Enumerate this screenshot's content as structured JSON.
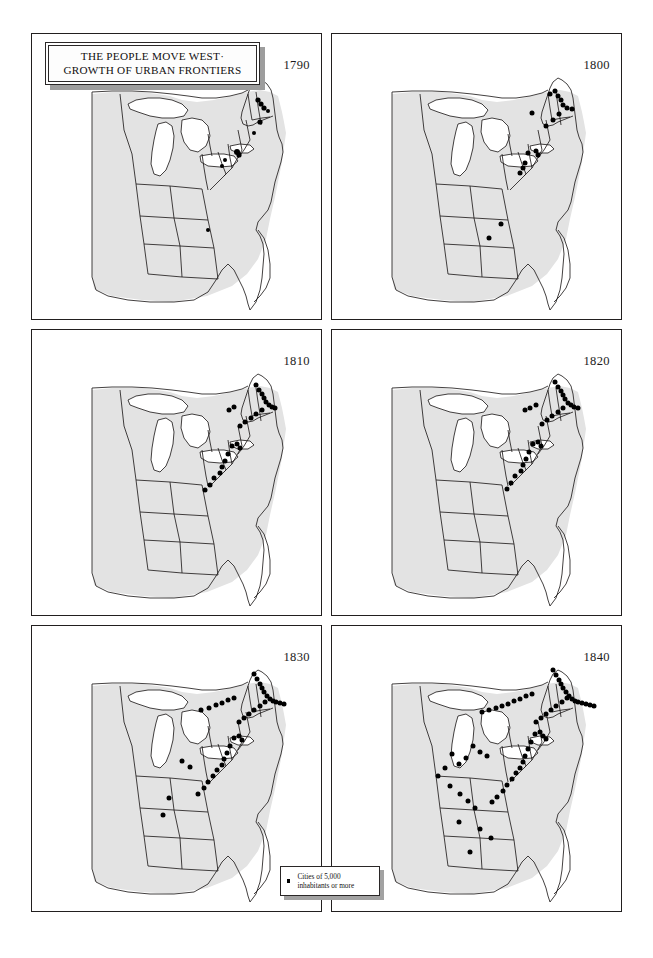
{
  "figure": {
    "title_line1": "THE PEOPLE MOVE WEST·",
    "title_line2": "GROWTH OF URBAN FRONTIERS",
    "land_color": "#e3e3e3",
    "water_color": "#ffffff",
    "border_color": "#221f1f",
    "dot_color": "#000000"
  },
  "legend": {
    "marker": "square-dot-icon",
    "line1": "Cities of 5,000",
    "line2": "inhabitants or more"
  },
  "panels": [
    {
      "year": "1790",
      "row": 0,
      "col": 0,
      "city_count": 11
    },
    {
      "year": "1800",
      "row": 0,
      "col": 1,
      "city_count": 18
    },
    {
      "year": "1810",
      "row": 1,
      "col": 0,
      "city_count": 25
    },
    {
      "year": "1820",
      "row": 1,
      "col": 1,
      "city_count": 27
    },
    {
      "year": "1830",
      "row": 2,
      "col": 0,
      "city_count": 39
    },
    {
      "year": "1840",
      "row": 2,
      "col": 1,
      "city_count": 61
    }
  ],
  "chart_data": {
    "type": "map",
    "title": "THE PEOPLE MOVE WEST· GROWTH OF URBAN FRONTIERS",
    "legend_entries": [
      "Cities of 5,000 inhabitants or more"
    ],
    "legend_position": "bottom-center",
    "region": "Eastern United States",
    "small_multiples": true,
    "grid": [
      2,
      3
    ],
    "series_label": "decade",
    "categories": [
      "1790",
      "1800",
      "1810",
      "1820",
      "1830",
      "1840"
    ],
    "values": [
      11,
      18,
      25,
      27,
      39,
      61
    ],
    "ylabel": "Number of cities of 5,000 inhabitants or more",
    "cities": {
      "1790": [
        [
          226,
          66
        ],
        [
          229,
          70
        ],
        [
          232,
          74
        ],
        [
          236,
          77
        ],
        [
          228,
          88
        ],
        [
          222,
          99
        ],
        [
          205,
          118
        ],
        [
          207,
          121
        ],
        [
          193,
          126
        ],
        [
          190,
          132
        ],
        [
          176,
          196
        ]
      ],
      "1800": [
        [
          218,
          60
        ],
        [
          223,
          57
        ],
        [
          226,
          62
        ],
        [
          229,
          66
        ],
        [
          231,
          71
        ],
        [
          235,
          74
        ],
        [
          240,
          75
        ],
        [
          227,
          80
        ],
        [
          221,
          86
        ],
        [
          214,
          92
        ],
        [
          200,
          79
        ],
        [
          204,
          117
        ],
        [
          206,
          121
        ],
        [
          196,
          119
        ],
        [
          193,
          129
        ],
        [
          191,
          134
        ],
        [
          188,
          139
        ],
        [
          169,
          190
        ],
        [
          157,
          204
        ]
      ],
      "1810": [
        [
          224,
          55
        ],
        [
          227,
          60
        ],
        [
          230,
          64
        ],
        [
          232,
          68
        ],
        [
          234,
          72
        ],
        [
          237,
          75
        ],
        [
          240,
          77
        ],
        [
          243,
          78
        ],
        [
          230,
          80
        ],
        [
          224,
          84
        ],
        [
          219,
          88
        ],
        [
          213,
          92
        ],
        [
          208,
          96
        ],
        [
          202,
          77
        ],
        [
          197,
          80
        ],
        [
          205,
          114
        ],
        [
          208,
          118
        ],
        [
          200,
          116
        ],
        [
          196,
          124
        ],
        [
          193,
          131
        ],
        [
          190,
          137
        ],
        [
          188,
          143
        ],
        [
          182,
          148
        ],
        [
          178,
          155
        ],
        [
          173,
          160
        ]
      ],
      "1820": [
        [
          223,
          52
        ],
        [
          226,
          57
        ],
        [
          229,
          61
        ],
        [
          231,
          65
        ],
        [
          233,
          69
        ],
        [
          236,
          73
        ],
        [
          239,
          75
        ],
        [
          242,
          77
        ],
        [
          246,
          78
        ],
        [
          231,
          78
        ],
        [
          226,
          82
        ],
        [
          220,
          86
        ],
        [
          215,
          90
        ],
        [
          210,
          94
        ],
        [
          204,
          75
        ],
        [
          198,
          78
        ],
        [
          193,
          80
        ],
        [
          206,
          112
        ],
        [
          209,
          116
        ],
        [
          201,
          114
        ],
        [
          197,
          122
        ],
        [
          194,
          129
        ],
        [
          191,
          135
        ],
        [
          189,
          141
        ],
        [
          183,
          146
        ],
        [
          179,
          153
        ],
        [
          175,
          159
        ]
      ],
      "1830": [
        [
          222,
          48
        ],
        [
          225,
          53
        ],
        [
          228,
          58
        ],
        [
          230,
          62
        ],
        [
          232,
          66
        ],
        [
          235,
          70
        ],
        [
          238,
          73
        ],
        [
          241,
          75
        ],
        [
          244,
          76
        ],
        [
          248,
          77
        ],
        [
          252,
          78
        ],
        [
          233,
          76
        ],
        [
          228,
          80
        ],
        [
          222,
          84
        ],
        [
          217,
          88
        ],
        [
          212,
          92
        ],
        [
          207,
          96
        ],
        [
          202,
          72
        ],
        [
          196,
          74
        ],
        [
          190,
          77
        ],
        [
          184,
          79
        ],
        [
          177,
          82
        ],
        [
          169,
          84
        ],
        [
          207,
          110
        ],
        [
          210,
          114
        ],
        [
          202,
          112
        ],
        [
          198,
          120
        ],
        [
          195,
          127
        ],
        [
          192,
          133
        ],
        [
          190,
          139
        ],
        [
          185,
          144
        ],
        [
          181,
          150
        ],
        [
          176,
          156
        ],
        [
          172,
          162
        ],
        [
          166,
          168
        ],
        [
          158,
          141
        ],
        [
          150,
          135
        ],
        [
          137,
          172
        ],
        [
          131,
          189
        ]
      ],
      "1840": [
        [
          221,
          44
        ],
        [
          224,
          49
        ],
        [
          227,
          54
        ],
        [
          229,
          58
        ],
        [
          231,
          62
        ],
        [
          234,
          66
        ],
        [
          237,
          70
        ],
        [
          240,
          73
        ],
        [
          243,
          75
        ],
        [
          246,
          76
        ],
        [
          250,
          77
        ],
        [
          254,
          78
        ],
        [
          258,
          79
        ],
        [
          262,
          80
        ],
        [
          235,
          72
        ],
        [
          230,
          76
        ],
        [
          224,
          80
        ],
        [
          219,
          84
        ],
        [
          214,
          88
        ],
        [
          209,
          92
        ],
        [
          204,
          96
        ],
        [
          200,
          68
        ],
        [
          194,
          70
        ],
        [
          188,
          73
        ],
        [
          182,
          75
        ],
        [
          176,
          78
        ],
        [
          170,
          80
        ],
        [
          164,
          82
        ],
        [
          157,
          84
        ],
        [
          150,
          86
        ],
        [
          208,
          106
        ],
        [
          211,
          110
        ],
        [
          214,
          113
        ],
        [
          203,
          108
        ],
        [
          199,
          116
        ],
        [
          196,
          123
        ],
        [
          193,
          130
        ],
        [
          191,
          136
        ],
        [
          188,
          142
        ],
        [
          184,
          147
        ],
        [
          180,
          153
        ],
        [
          175,
          159
        ],
        [
          171,
          165
        ],
        [
          165,
          171
        ],
        [
          160,
          176
        ],
        [
          155,
          130
        ],
        [
          148,
          126
        ],
        [
          141,
          120
        ],
        [
          134,
          132
        ],
        [
          127,
          138
        ],
        [
          120,
          128
        ],
        [
          113,
          142
        ],
        [
          106,
          150
        ],
        [
          118,
          160
        ],
        [
          128,
          168
        ],
        [
          136,
          175
        ],
        [
          143,
          182
        ],
        [
          127,
          196
        ],
        [
          148,
          203
        ],
        [
          159,
          212
        ],
        [
          138,
          226
        ]
      ]
    }
  }
}
